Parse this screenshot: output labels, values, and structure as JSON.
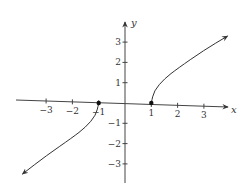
{
  "chart_data": {
    "type": "line",
    "title": "",
    "xlabel": "x",
    "ylabel": "y",
    "xlim": [
      -4,
      4
    ],
    "ylim": [
      -4,
      4
    ],
    "grid": false,
    "x_ticks": [
      -3,
      -2,
      -1,
      1,
      2,
      3
    ],
    "x_tick_labels": [
      "−3",
      "−2",
      "−1",
      "1",
      "2",
      "3"
    ],
    "y_ticks": [
      3,
      2,
      1,
      -1,
      -2,
      -3
    ],
    "y_tick_labels": [
      "3",
      "2",
      "1",
      "−1",
      "−2",
      "−3"
    ],
    "series": [
      {
        "name": "right-branch",
        "start_point": [
          1,
          0
        ],
        "start_marker": "closed-dot",
        "end_arrow": true,
        "points": [
          [
            1,
            0
          ],
          [
            1.1,
            0.6
          ],
          [
            1.5,
            1.2
          ],
          [
            2,
            1.7
          ],
          [
            3,
            2.6
          ],
          [
            3.9,
            3.3
          ]
        ]
      },
      {
        "name": "left-branch",
        "start_point": [
          -1,
          0
        ],
        "start_marker": "closed-dot",
        "end_arrow": true,
        "points": [
          [
            -1,
            0
          ],
          [
            -1.1,
            -0.6
          ],
          [
            -1.5,
            -1.2
          ],
          [
            -2,
            -1.7
          ],
          [
            -3,
            -2.6
          ],
          [
            -3.9,
            -3.5
          ]
        ]
      }
    ],
    "annotations": [
      {
        "type": "dot",
        "x": -1,
        "y": 0
      },
      {
        "type": "dot",
        "x": 1,
        "y": 0
      }
    ]
  },
  "colors": {
    "axis": "#444444",
    "curve": "#333333",
    "background": "#ffffff"
  }
}
